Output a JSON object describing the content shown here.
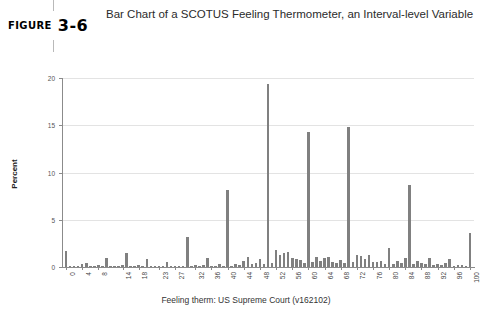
{
  "figure": {
    "tag_keyword": "FIGURE",
    "tag_number": "3-6",
    "title": "Bar Chart of a SCOTUS Feeling Thermometer, an Interval-level Variable"
  },
  "chart_data": {
    "type": "bar",
    "title": "Bar Chart of a SCOTUS Feeling Thermometer, an Interval-level Variable",
    "xlabel": "Feeling therm: US Supreme Court (v162102)",
    "ylabel": "Percent",
    "ylim": [
      0,
      20
    ],
    "xlim": [
      -1,
      101
    ],
    "yticks": [
      0,
      5,
      10,
      15,
      20
    ],
    "ytick_labels": [
      "0",
      "5",
      "10",
      "15",
      "20"
    ],
    "xticks": [
      0,
      4,
      8,
      14,
      18,
      23,
      27,
      32,
      36,
      40,
      44,
      48,
      52,
      56,
      60,
      64,
      68,
      72,
      76,
      80,
      84,
      88,
      92,
      96,
      100
    ],
    "xtick_labels": [
      "0",
      "4",
      "8",
      "14",
      "18",
      "23",
      "27",
      "32",
      "36",
      "40",
      "44",
      "48",
      "52",
      "56",
      "60",
      "64",
      "68",
      "72",
      "76",
      "80",
      "84",
      "88",
      "92",
      "96",
      "100"
    ],
    "grid": true,
    "grid_axis": "y",
    "legend": false,
    "bar_color": "#808080",
    "categories": [
      0,
      1,
      2,
      3,
      4,
      5,
      6,
      7,
      8,
      9,
      10,
      11,
      12,
      13,
      14,
      15,
      16,
      17,
      18,
      19,
      20,
      21,
      22,
      23,
      24,
      25,
      26,
      27,
      28,
      29,
      30,
      31,
      32,
      33,
      34,
      35,
      36,
      37,
      38,
      39,
      40,
      41,
      42,
      43,
      44,
      45,
      46,
      47,
      48,
      49,
      50,
      51,
      52,
      53,
      54,
      55,
      56,
      57,
      58,
      59,
      60,
      61,
      62,
      63,
      64,
      65,
      66,
      67,
      68,
      69,
      70,
      71,
      72,
      73,
      74,
      75,
      76,
      77,
      78,
      79,
      80,
      81,
      82,
      83,
      84,
      85,
      86,
      87,
      88,
      89,
      90,
      91,
      92,
      93,
      94,
      95,
      96,
      97,
      98,
      99,
      100
    ],
    "values": [
      1.7,
      0.06,
      0.1,
      0.06,
      0.3,
      0.45,
      0.1,
      0.05,
      0.25,
      0.05,
      0.95,
      0.05,
      0.15,
      0.05,
      0.2,
      1.45,
      0.1,
      0.1,
      0.2,
      0.05,
      0.8,
      0.05,
      0.1,
      0.1,
      0.15,
      0.55,
      0.05,
      0.1,
      0.15,
      0.05,
      3.2,
      0.05,
      0.25,
      0.05,
      0.2,
      0.95,
      0.1,
      0.15,
      0.3,
      0.05,
      8.1,
      0.1,
      0.35,
      0.2,
      0.65,
      1.05,
      0.3,
      0.4,
      0.85,
      0.35,
      19.4,
      0.45,
      1.85,
      1.3,
      1.45,
      1.55,
      0.95,
      0.85,
      0.7,
      0.45,
      14.3,
      0.55,
      1.05,
      0.65,
      0.95,
      1.05,
      0.55,
      0.45,
      0.75,
      0.4,
      14.8,
      0.5,
      1.25,
      1.15,
      0.85,
      1.25,
      0.55,
      0.55,
      0.6,
      0.35,
      2.0,
      0.35,
      0.65,
      0.45,
      1.0,
      8.7,
      0.35,
      0.65,
      0.45,
      0.3,
      1.0,
      0.2,
      0.35,
      0.25,
      0.4,
      0.9,
      0.15,
      0.25,
      0.2,
      0.15,
      3.6
    ]
  }
}
